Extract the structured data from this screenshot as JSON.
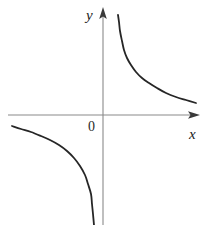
{
  "figure": {
    "title": "",
    "background_color": "#ffffff",
    "width": 206,
    "height": 225
  },
  "labels": {
    "y_axis": "y",
    "x_axis": "x",
    "origin": "0"
  },
  "colors": {
    "axis": "#8a8a8a",
    "curve": "#262626",
    "arrow": "#3a3a3a",
    "text": "#1a1a1a",
    "background": "#ffffff"
  },
  "chart_data": {
    "type": "line",
    "title": "",
    "xlabel": "x",
    "ylabel": "y",
    "grid": false,
    "legend": null,
    "axes": {
      "origin_label": "0",
      "x_axis_y_px": 115,
      "y_axis_x_px": 103,
      "x_axis_from_px": 8,
      "x_axis_to_px": 200,
      "y_axis_from_px": 8,
      "y_axis_to_px": 225,
      "x_arrow": "right",
      "y_arrow": "up",
      "ticks": [],
      "tick_labels": []
    },
    "function": "y = k/x, k > 0",
    "asymptotes": {
      "vertical": "x = 0",
      "horizontal": "y = 0"
    },
    "series": [
      {
        "name": "branch-quadrant-I",
        "quadrant": 1,
        "points_px": [
          [
            118,
            15
          ],
          [
            119,
            22
          ],
          [
            120,
            31
          ],
          [
            122,
            41
          ],
          [
            124,
            50
          ],
          [
            127,
            58
          ],
          [
            131,
            65
          ],
          [
            136,
            72
          ],
          [
            142,
            78
          ],
          [
            149,
            83
          ],
          [
            157,
            88
          ],
          [
            166,
            93
          ],
          [
            176,
            97
          ],
          [
            186,
            100
          ],
          [
            196,
            103
          ]
        ]
      },
      {
        "name": "branch-quadrant-III",
        "quadrant": 3,
        "points_px": [
          [
            12,
            126
          ],
          [
            21,
            129
          ],
          [
            31,
            132
          ],
          [
            41,
            136
          ],
          [
            50,
            140
          ],
          [
            59,
            145
          ],
          [
            67,
            151
          ],
          [
            74,
            158
          ],
          [
            80,
            166
          ],
          [
            85,
            175
          ],
          [
            88,
            184
          ],
          [
            91,
            194
          ],
          [
            92,
            204
          ],
          [
            93,
            214
          ],
          [
            94,
            225
          ]
        ]
      }
    ]
  }
}
